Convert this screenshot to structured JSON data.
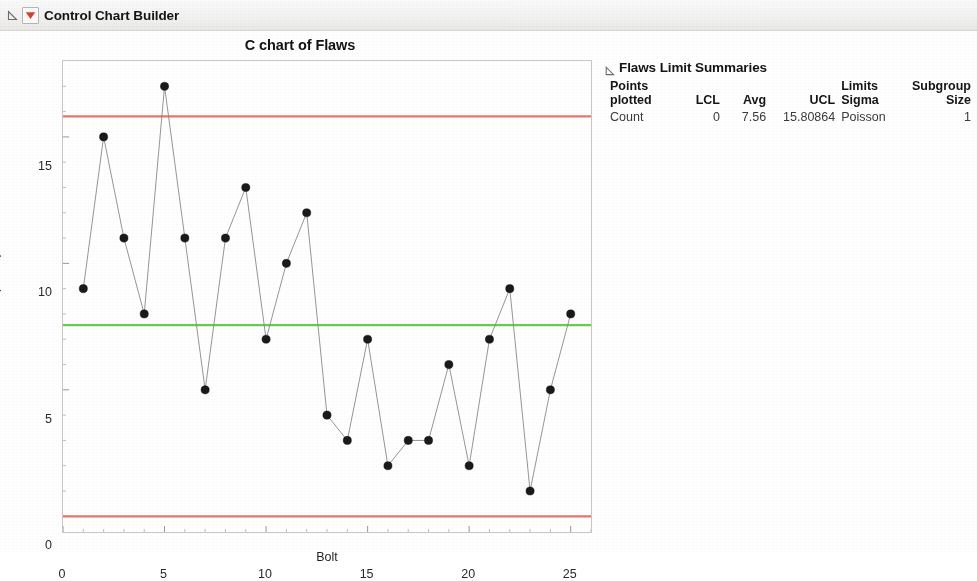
{
  "window": {
    "title": "Control Chart Builder",
    "disclosure_icon": "triangle-disclosure-icon",
    "menu_icon": "red-triangle-menu-icon"
  },
  "chart_panel": {
    "title": "C chart of Flaws"
  },
  "report": {
    "disclosure_icon": "triangle-disclosure-icon",
    "title": "Flaws Limit Summaries",
    "columns": [
      "Points\nplotted",
      "LCL",
      "Avg",
      "UCL",
      "Limits\nSigma",
      "Subgroup\nSize"
    ],
    "rows": [
      {
        "points_plotted": "Count",
        "lcl": "0",
        "avg": "7.56",
        "ucl": "15.80864",
        "limits_sigma": "Poisson",
        "subgroup_size": "1"
      }
    ]
  },
  "colors": {
    "ucl_lcl_line": "#e8756a",
    "center_line": "#66cc55",
    "point": "#1a1a1a",
    "connector": "#8a8a8a",
    "frame": "#c9c7c4"
  },
  "chart_data": {
    "type": "line",
    "title": "C chart of Flaws",
    "subtitle": "",
    "xlabel": "Bolt",
    "ylabel": "Count(Flaws)",
    "xlim": [
      0,
      26
    ],
    "ylim": [
      -0.62,
      18.0
    ],
    "xticks": [
      0,
      5,
      10,
      15,
      20,
      25
    ],
    "yticks": [
      0,
      5,
      10,
      15
    ],
    "x_minor_ticks": [
      1,
      2,
      3,
      4,
      6,
      7,
      8,
      9,
      11,
      12,
      13,
      14,
      16,
      17,
      18,
      19,
      21,
      22,
      23,
      24,
      26
    ],
    "y_minor_ticks": [
      1,
      2,
      3,
      4,
      6,
      7,
      8,
      9,
      11,
      12,
      13,
      14,
      16,
      17
    ],
    "grid": false,
    "legend": "none",
    "x": [
      1,
      2,
      3,
      4,
      5,
      6,
      7,
      8,
      9,
      10,
      11,
      12,
      13,
      14,
      15,
      16,
      17,
      18,
      19,
      20,
      21,
      22,
      23,
      24,
      25
    ],
    "series": [
      {
        "name": "Count(Flaws)",
        "values": [
          9,
          15,
          11,
          8,
          17,
          11,
          5,
          11,
          13,
          7,
          10,
          12,
          4,
          3,
          7,
          2,
          3,
          3,
          6,
          2,
          7,
          9,
          1,
          5,
          8
        ]
      }
    ],
    "reference_lines": [
      {
        "name": "UCL",
        "value": 15.80864,
        "color": "#e8756a"
      },
      {
        "name": "Avg",
        "value": 7.56,
        "color": "#66cc55"
      },
      {
        "name": "LCL",
        "value": 0,
        "color": "#e8756a"
      }
    ]
  }
}
